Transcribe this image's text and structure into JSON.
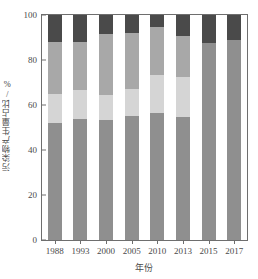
{
  "chart_data": {
    "type": "bar",
    "subtype": "stacked-percentage",
    "title": "",
    "xlabel": "年份",
    "ylabel": "污染物产生量占比/%",
    "categories": [
      "1988",
      "1993",
      "2000",
      "2005",
      "2010",
      "2013",
      "2015",
      "2017"
    ],
    "ylim": [
      0,
      100
    ],
    "yticks": [
      0,
      20,
      40,
      60,
      80,
      100
    ],
    "grid": false,
    "legend": "none",
    "series": [
      {
        "name": "segment-1-bottom",
        "color": "#8f8f8f",
        "values": [
          52.0,
          54.0,
          53.5,
          55.0,
          56.5,
          54.5,
          87.5,
          89.0
        ]
      },
      {
        "name": "segment-2-light",
        "color": "#d5d5d5",
        "values": [
          13.0,
          12.5,
          11.0,
          12.0,
          17.0,
          18.0,
          0.0,
          0.0
        ]
      },
      {
        "name": "segment-3-medium",
        "color": "#a8a8a8",
        "values": [
          23.0,
          21.5,
          27.0,
          25.0,
          21.0,
          18.0,
          0.0,
          0.0
        ]
      },
      {
        "name": "segment-4-dark",
        "color": "#4a4a4a",
        "values": [
          12.0,
          12.0,
          8.5,
          8.0,
          5.5,
          9.5,
          12.5,
          11.0
        ]
      }
    ],
    "cumulative_tops": [
      [
        52.0,
        65.0,
        88.0,
        100.0
      ],
      [
        54.0,
        66.5,
        88.0,
        100.0
      ],
      [
        53.5,
        64.5,
        91.5,
        100.0
      ],
      [
        55.0,
        67.0,
        92.0,
        100.0
      ],
      [
        56.5,
        73.5,
        94.5,
        100.0
      ],
      [
        54.5,
        72.5,
        90.5,
        100.0
      ],
      [
        87.5,
        87.5,
        87.5,
        100.0
      ],
      [
        89.0,
        89.0,
        89.0,
        100.0
      ]
    ],
    "axis_color": "#6e6e6e",
    "text_color": "#4a4a4a",
    "background": "#ffffff"
  }
}
